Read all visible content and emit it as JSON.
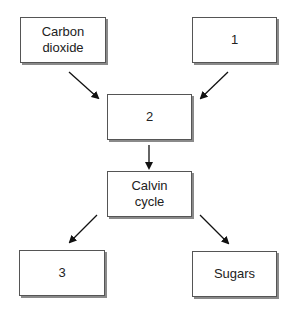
{
  "nodes": {
    "carbon_dioxide": {
      "label_line1": "Carbon",
      "label_line2": "dioxide"
    },
    "box1": {
      "label": "1"
    },
    "box2": {
      "label": "2"
    },
    "calvin": {
      "label_line1": "Calvin",
      "label_line2": "cycle"
    },
    "box3": {
      "label": "3"
    },
    "sugars": {
      "label": "Sugars"
    }
  },
  "edges": [
    {
      "from": "carbon_dioxide",
      "to": "box2"
    },
    {
      "from": "box1",
      "to": "box2"
    },
    {
      "from": "box2",
      "to": "calvin"
    },
    {
      "from": "calvin",
      "to": "box3"
    },
    {
      "from": "calvin",
      "to": "sugars"
    }
  ],
  "colors": {
    "border": "#555555",
    "shadow": "#8a8a8a",
    "arrow": "#111111"
  }
}
